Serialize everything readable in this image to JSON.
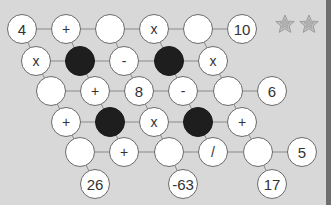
{
  "game": {
    "stars": {
      "earned": 0,
      "total": 2,
      "color": "#a8a8a8",
      "fill": "#bdbdbd"
    },
    "colors": {
      "background": "#d8d8d8",
      "node_fill": "#ffffff",
      "node_border": "#6a6a6a",
      "blocked": "#1e1e1e",
      "line": "#8a8a8a",
      "edge_bar": "#6e6e6e"
    },
    "nodes": [
      {
        "id": "r1c1",
        "x": 22,
        "y": 29,
        "type": "number",
        "value": "4"
      },
      {
        "id": "r1c2",
        "x": 66,
        "y": 29,
        "type": "op",
        "value": "+"
      },
      {
        "id": "r1c3",
        "x": 110,
        "y": 29,
        "type": "empty",
        "value": ""
      },
      {
        "id": "r1c4",
        "x": 154,
        "y": 29,
        "type": "op",
        "value": "x"
      },
      {
        "id": "r1c5",
        "x": 198,
        "y": 29,
        "type": "empty",
        "value": ""
      },
      {
        "id": "r1c6",
        "x": 242,
        "y": 29,
        "type": "result",
        "value": "10"
      },
      {
        "id": "r2c1",
        "x": 36,
        "y": 61,
        "type": "op",
        "value": "x"
      },
      {
        "id": "r2c2",
        "x": 80,
        "y": 61,
        "type": "blocked",
        "value": ""
      },
      {
        "id": "r2c3",
        "x": 124,
        "y": 61,
        "type": "op",
        "value": "-"
      },
      {
        "id": "r2c4",
        "x": 169,
        "y": 61,
        "type": "blocked",
        "value": ""
      },
      {
        "id": "r2c5",
        "x": 213,
        "y": 61,
        "type": "op",
        "value": "x"
      },
      {
        "id": "r3c1",
        "x": 51,
        "y": 91,
        "type": "empty",
        "value": ""
      },
      {
        "id": "r3c2",
        "x": 95,
        "y": 91,
        "type": "op",
        "value": "+"
      },
      {
        "id": "r3c3",
        "x": 139,
        "y": 91,
        "type": "number",
        "value": "8"
      },
      {
        "id": "r3c4",
        "x": 183,
        "y": 91,
        "type": "op",
        "value": "-"
      },
      {
        "id": "r3c5",
        "x": 228,
        "y": 91,
        "type": "empty",
        "value": ""
      },
      {
        "id": "r3c6",
        "x": 272,
        "y": 91,
        "type": "result",
        "value": "6"
      },
      {
        "id": "r4c1",
        "x": 66,
        "y": 122,
        "type": "op",
        "value": "+"
      },
      {
        "id": "r4c2",
        "x": 110,
        "y": 122,
        "type": "blocked",
        "value": ""
      },
      {
        "id": "r4c3",
        "x": 154,
        "y": 122,
        "type": "op",
        "value": "x"
      },
      {
        "id": "r4c4",
        "x": 198,
        "y": 122,
        "type": "blocked",
        "value": ""
      },
      {
        "id": "r4c5",
        "x": 242,
        "y": 122,
        "type": "op",
        "value": "+"
      },
      {
        "id": "r5c1",
        "x": 80,
        "y": 152,
        "type": "empty",
        "value": ""
      },
      {
        "id": "r5c2",
        "x": 124,
        "y": 152,
        "type": "op",
        "value": "+"
      },
      {
        "id": "r5c3",
        "x": 169,
        "y": 152,
        "type": "empty",
        "value": ""
      },
      {
        "id": "r5c4",
        "x": 213,
        "y": 152,
        "type": "op",
        "value": "/"
      },
      {
        "id": "r5c5",
        "x": 258,
        "y": 152,
        "type": "empty",
        "value": ""
      },
      {
        "id": "r5c6",
        "x": 302,
        "y": 152,
        "type": "result",
        "value": "5"
      },
      {
        "id": "r6c1",
        "x": 95,
        "y": 184,
        "type": "result",
        "value": "26"
      },
      {
        "id": "r6c2",
        "x": 183,
        "y": 184,
        "type": "result",
        "value": "-63"
      },
      {
        "id": "r6c3",
        "x": 272,
        "y": 184,
        "type": "result",
        "value": "17"
      }
    ],
    "edges": [
      [
        "r1c1",
        "r1c2"
      ],
      [
        "r1c2",
        "r1c3"
      ],
      [
        "r1c3",
        "r1c4"
      ],
      [
        "r1c4",
        "r1c5"
      ],
      [
        "r1c5",
        "r1c6"
      ],
      [
        "r2c1",
        "r2c2"
      ],
      [
        "r2c2",
        "r2c3"
      ],
      [
        "r2c3",
        "r2c4"
      ],
      [
        "r2c4",
        "r2c5"
      ],
      [
        "r3c1",
        "r3c2"
      ],
      [
        "r3c2",
        "r3c3"
      ],
      [
        "r3c3",
        "r3c4"
      ],
      [
        "r3c4",
        "r3c5"
      ],
      [
        "r3c5",
        "r3c6"
      ],
      [
        "r4c1",
        "r4c2"
      ],
      [
        "r4c2",
        "r4c3"
      ],
      [
        "r4c3",
        "r4c4"
      ],
      [
        "r4c4",
        "r4c5"
      ],
      [
        "r5c1",
        "r5c2"
      ],
      [
        "r5c2",
        "r5c3"
      ],
      [
        "r5c3",
        "r5c4"
      ],
      [
        "r5c4",
        "r5c5"
      ],
      [
        "r5c5",
        "r5c6"
      ],
      [
        "r1c1",
        "r2c1"
      ],
      [
        "r2c1",
        "r3c1"
      ],
      [
        "r3c1",
        "r4c1"
      ],
      [
        "r4c1",
        "r5c1"
      ],
      [
        "r5c1",
        "r6c1"
      ],
      [
        "r1c3",
        "r2c3"
      ],
      [
        "r2c3",
        "r3c3"
      ],
      [
        "r3c3",
        "r4c3"
      ],
      [
        "r4c3",
        "r5c3"
      ],
      [
        "r5c3",
        "r6c2"
      ],
      [
        "r1c5",
        "r2c5"
      ],
      [
        "r2c5",
        "r3c5"
      ],
      [
        "r3c5",
        "r4c5"
      ],
      [
        "r4c5",
        "r5c5"
      ],
      [
        "r5c5",
        "r6c3"
      ],
      [
        "r1c2",
        "r2c2"
      ],
      [
        "r2c2",
        "r3c2"
      ],
      [
        "r1c4",
        "r2c4"
      ],
      [
        "r2c4",
        "r3c4"
      ],
      [
        "r3c2",
        "r4c2"
      ],
      [
        "r4c2",
        "r5c2"
      ],
      [
        "r3c4",
        "r4c4"
      ],
      [
        "r4c4",
        "r5c4"
      ]
    ]
  }
}
